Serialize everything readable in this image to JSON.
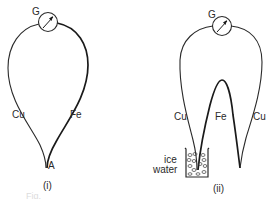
{
  "diagram_i": {
    "galvanometer_label": "G",
    "left_wire_label": "Cu",
    "right_wire_label": "Fe",
    "junction_label": "A",
    "caption": "(i)"
  },
  "diagram_ii": {
    "galvanometer_label": "G",
    "left_wire_label": "Cu",
    "middle_wire_label": "Fe",
    "right_wire_label": "Cu",
    "beaker_label_line1": "ice",
    "beaker_label_line2": "water",
    "caption": "(ii)"
  },
  "figure_caption_partial": "Fig."
}
